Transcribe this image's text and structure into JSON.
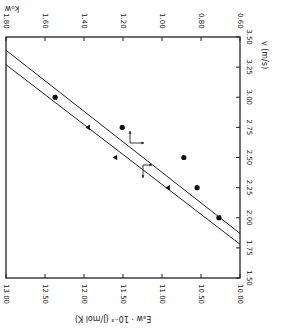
{
  "chart_data": {
    "type": "scatter",
    "orientation": "rotated-180",
    "title": "",
    "bottom_axis": {
      "label": "Eₐw · 10⁻³ (J/mol K)",
      "ticks": [
        "13.00",
        "12.50",
        "12.00",
        "11.50",
        "11.00",
        "10.50",
        "10.00"
      ],
      "range": [
        13.0,
        10.0
      ]
    },
    "top_axis": {
      "label": "kₒw",
      "ticks": [
        "1.80",
        "1.60",
        "1.40",
        "1.20",
        "1.00",
        "0.80",
        "0.60"
      ],
      "range": [
        1.8,
        0.6
      ]
    },
    "right_axis": {
      "label": "v (m/s)",
      "ticks": [
        "3.50",
        "3.25",
        "3.00",
        "2.75",
        "2.50",
        "2.25",
        "2.00",
        "1.75",
        "1.50"
      ],
      "range": [
        3.5,
        1.5
      ]
    },
    "series": [
      {
        "name": "E (circles)",
        "marker": "circle",
        "axis": "bottom",
        "points": [
          {
            "v": 3.0,
            "x": 12.37
          },
          {
            "v": 2.75,
            "x": 11.51
          },
          {
            "v": 2.5,
            "x": 10.72
          },
          {
            "v": 2.25,
            "x": 10.55
          },
          {
            "v": 2.0,
            "x": 10.27
          }
        ]
      },
      {
        "name": "k (triangles)",
        "marker": "triangle",
        "axis": "top",
        "points": [
          {
            "v": 3.0,
            "x": 1.55
          },
          {
            "v": 2.75,
            "x": 1.38
          },
          {
            "v": 2.5,
            "x": 1.24
          },
          {
            "v": 2.25,
            "x": 0.97
          },
          {
            "v": 2.0,
            "x": 0.71
          }
        ]
      }
    ],
    "lines": [
      {
        "name": "upper-fit",
        "from": {
          "x_frac": 0.0,
          "v": 3.39
        },
        "to": {
          "x_frac": 1.0,
          "v": 1.87
        }
      },
      {
        "name": "lower-fit",
        "from": {
          "x_frac": 0.0,
          "v": 3.27
        },
        "to": {
          "x_frac": 1.0,
          "v": 1.78
        }
      }
    ],
    "annotations": [
      {
        "type": "arrows",
        "directions": [
          "up",
          "right"
        ],
        "near_v": 2.63,
        "near_k": 1.22
      },
      {
        "type": "arrows",
        "directions": [
          "down",
          "right"
        ],
        "near_v": 2.45,
        "near_k": 1.15
      }
    ]
  }
}
